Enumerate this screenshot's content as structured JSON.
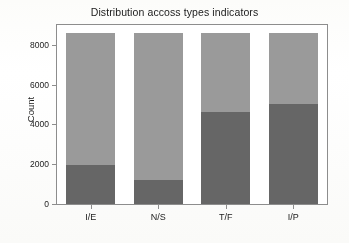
{
  "chart_data": {
    "type": "bar",
    "subtype": "stacked-bar",
    "title": "Distribution accoss types indicators",
    "xlabel": "",
    "ylabel": "Count",
    "categories": [
      "I/E",
      "N/S",
      "T/F",
      "I/P"
    ],
    "series": [
      {
        "name": "first letter",
        "color": "#666666",
        "values": [
          1950,
          1200,
          4610,
          5020
        ]
      },
      {
        "name": "second letter",
        "color": "#9a9a9a",
        "values": [
          6650,
          7400,
          3990,
          3580
        ]
      }
    ],
    "totals": [
      8600,
      8600,
      8600,
      8600
    ],
    "ylim": [
      0,
      9000
    ],
    "yticks": [
      0,
      2000,
      4000,
      6000,
      8000
    ],
    "ytick_labels": [
      "0",
      "2000",
      "4000",
      "6000",
      "8000"
    ],
    "grid": false,
    "legend": "none",
    "bar_width_fraction": 0.72
  },
  "axes": {
    "y_title": "Count",
    "y_tick_labels": [
      "8000",
      "6000",
      "4000",
      "2000",
      "0"
    ],
    "x_tick_labels": [
      "I/E",
      "N/S",
      "T/F",
      "I/P"
    ]
  },
  "colors": {
    "dark_segment": "#666666",
    "light_segment": "#9a9a9a",
    "frame": "#8d8d8d",
    "text": "#1b1b1b",
    "background": "#ffffff"
  }
}
